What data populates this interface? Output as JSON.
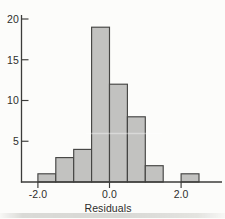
{
  "figure": {
    "background": "#fcfcfa",
    "kind": "scanned histogram figure"
  },
  "chart_data": {
    "type": "bar",
    "subtype": "histogram",
    "title": "",
    "xlabel": "Residuals",
    "ylabel": "",
    "bin_edges": [
      -2.0,
      -1.5,
      -1.0,
      -0.5,
      0.0,
      0.5,
      1.0,
      1.5,
      2.0,
      2.5
    ],
    "values": [
      1,
      3,
      4,
      19,
      12,
      8,
      2,
      0,
      1
    ],
    "x_ticks": [
      {
        "v": -2.0,
        "label": "-2.0"
      },
      {
        "v": 0.0,
        "label": "0.0"
      },
      {
        "v": 2.0,
        "label": "2.0"
      }
    ],
    "y_ticks": [
      {
        "v": 5,
        "label": "5"
      },
      {
        "v": 10,
        "label": "10"
      },
      {
        "v": 15,
        "label": "15"
      },
      {
        "v": 20,
        "label": "20"
      }
    ],
    "xlim": [
      -2.5,
      3.2
    ],
    "ylim": [
      0,
      20.5
    ],
    "grid": false,
    "legend": null,
    "colors": {
      "bar_fill": "#c2c2c0",
      "bar_stroke": "#454543",
      "axis": "#3c3c3a",
      "tick": "#3c3c3a",
      "text": "#2e2e2c",
      "background": "#fcfcfa"
    }
  }
}
